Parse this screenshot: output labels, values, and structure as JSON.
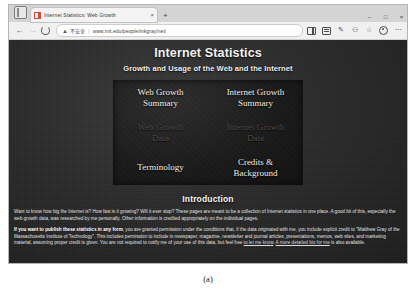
{
  "browser": {
    "tab": {
      "title": "Internet Statistics: Web Growth",
      "favicon": "page-favicon",
      "close_label": "×"
    },
    "new_tab_label": "+",
    "window_controls": [
      {
        "name": "minimize",
        "glyph": "–"
      },
      {
        "name": "maximize",
        "glyph": "□"
      },
      {
        "name": "close",
        "glyph": "×"
      }
    ],
    "nav": {
      "back": "←",
      "forward": "→",
      "reload": "reload-icon"
    },
    "omnibox": {
      "security_icon": "warning-triangle-icon",
      "security_label": "不安全",
      "separator": "|",
      "url": "www.mit.edu/people/mkgray/net/"
    },
    "toolbar_right": [
      {
        "name": "split-screen-icon",
        "glyph": ""
      },
      {
        "name": "collections-icon",
        "glyph": ""
      },
      {
        "name": "edit-pen-icon",
        "glyph": "✎"
      },
      {
        "name": "extensions-icon",
        "glyph": "⚇"
      },
      {
        "name": "favorite-star-icon",
        "glyph": "☆"
      },
      {
        "name": "profile-avatar-icon",
        "glyph": ""
      },
      {
        "name": "more-menu-icon",
        "glyph": "⋯"
      }
    ]
  },
  "page": {
    "title": "Internet Statistics",
    "subtitle": "Growth and Usage of the Web and the Internet",
    "nav_cells": [
      {
        "label": "Web Growth\nSummary",
        "state": "active"
      },
      {
        "label": "Internet Growth\nSummary",
        "state": "active"
      },
      {
        "label": "Web Growth\nData",
        "state": "dim"
      },
      {
        "label": "Internet Growth\nData",
        "state": "dim"
      },
      {
        "label": "Terminology",
        "state": "active"
      },
      {
        "label": "Credits &\nBackground",
        "state": "active"
      }
    ],
    "intro_heading": "Introduction",
    "paragraph_1": "Want to know how big the Internet is? How fast is it growing? Will it ever stop? These pages are meant to be a collection of Internet statistics in one place. A good bit of this, especially the web growth data, was researched by me personally. Other information is credited appropriately on the individual pages.",
    "paragraph_2_bold": "If you want to publish these statistics in any form",
    "paragraph_2_rest": ", you are granted permission under the conditions that, if the data originated with me, you include explicit credit to \"Matthew Gray of the Massachusetts Institute of Technology\". This includes permission to include in newspaper, magazine, newsletter and journal articles, presentations, memos, web sites, and marketing material, assuming proper credit is given. You are not required to notify me of your use of this data, but feel free ",
    "link_1": "to let me know",
    "paragraph_2_mid": ". ",
    "link_2": "A more detailed bio for me",
    "paragraph_2_end": " is also available."
  },
  "caption": "(a)"
}
